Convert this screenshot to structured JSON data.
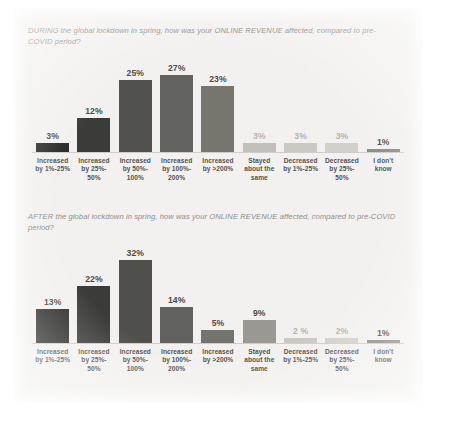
{
  "page": {
    "background_color": "#f2f1ef"
  },
  "categories": [
    "Increased by 1%-25%",
    "Increased by 25%-50%",
    "Increased by 50%-100%",
    "Increased by 100%-200%",
    "Increased by >200%",
    "Stayed about the same",
    "Decreased by 1%-25%",
    "Decreased by 25%-50%",
    "I don't know"
  ],
  "chart_data": [
    {
      "type": "bar",
      "title": "DURING the global lockdown in spring, how was your ONLINE REVENUE affected, compared to pre-COVID period?",
      "categories": [
        "Increased by 1%-25%",
        "Increased by 25%-50%",
        "Increased by 50%-100%",
        "Increased by 100%-200%",
        "Increased by >200%",
        "Stayed about the same",
        "Decreased by 1%-25%",
        "Decreased by 25%-50%",
        "I don't know"
      ],
      "category_lines": [
        [
          "Increased",
          "by 1%-25%"
        ],
        [
          "Increased",
          "by 25%-",
          "50%"
        ],
        [
          "Increased",
          "by 50%-",
          "100%"
        ],
        [
          "Increased",
          "by 100%-",
          "200%"
        ],
        [
          "Increased",
          "by >200%"
        ],
        [
          "Stayed",
          "about the",
          "same"
        ],
        [
          "Decreased",
          "by 1%-25%"
        ],
        [
          "Decreased",
          "by 25%-",
          "50%"
        ],
        [
          "I don't",
          "know"
        ]
      ],
      "values": [
        3,
        12,
        25,
        27,
        23,
        3,
        3,
        3,
        1
      ],
      "value_labels": [
        "3%",
        "12%",
        "25%",
        "27%",
        "23%",
        "3%",
        "3%",
        "3%",
        "1%"
      ],
      "bar_colors": [
        "#2a2a28",
        "#3b3b39",
        "#51514e",
        "#636360",
        "#76766f",
        "#c2c0bb",
        "#cbc9c4",
        "#d2d0cb",
        "#8c8a86"
      ],
      "label_faint": [
        false,
        false,
        false,
        false,
        false,
        true,
        true,
        true,
        false
      ],
      "xlabel": "",
      "ylabel": "",
      "ylim": [
        0,
        30
      ],
      "grid": false,
      "legend": "none"
    },
    {
      "type": "bar",
      "title": "AFTER the global lockdown in spring, how was your ONLINE REVENUE affected, compared to pre-COVID period?",
      "categories": [
        "Increased by 1%-25%",
        "Increased by 25%-50%",
        "Increased by 50%-100%",
        "Increased by 100%-200%",
        "Increased by >200%",
        "Stayed about the same",
        "Decreased by 1%-25%",
        "Decreased by 25%-50%",
        "I don't know"
      ],
      "category_lines": [
        [
          "Increased",
          "by 1%-25%"
        ],
        [
          "Increased",
          "by 25%-",
          "50%"
        ],
        [
          "Increased",
          "by 50%-",
          "100%"
        ],
        [
          "Increased",
          "by 100%-",
          "200%"
        ],
        [
          "Increased",
          "by >200%"
        ],
        [
          "Stayed",
          "about the",
          "same"
        ],
        [
          "Decreased",
          "by 1%-25%"
        ],
        [
          "Decreased",
          "by 25%-",
          "50%"
        ],
        [
          "I don't",
          "know"
        ]
      ],
      "values": [
        13,
        22,
        32,
        14,
        5,
        9,
        2,
        2,
        1
      ],
      "value_labels": [
        "13%",
        "22%",
        "32%",
        "14%",
        "5%",
        "9%",
        "2 %",
        "2%",
        "1%"
      ],
      "bar_colors": [
        "#2a2a28",
        "#3b3b39",
        "#4f4f4c",
        "#626260",
        "#74746f",
        "#9a9893",
        "#cbc9c4",
        "#d2d0cb",
        "#8c8a86"
      ],
      "label_faint": [
        false,
        false,
        false,
        false,
        false,
        false,
        true,
        true,
        false
      ],
      "xlabel": "",
      "ylabel": "",
      "ylim": [
        0,
        35
      ],
      "grid": false,
      "legend": "none"
    }
  ]
}
